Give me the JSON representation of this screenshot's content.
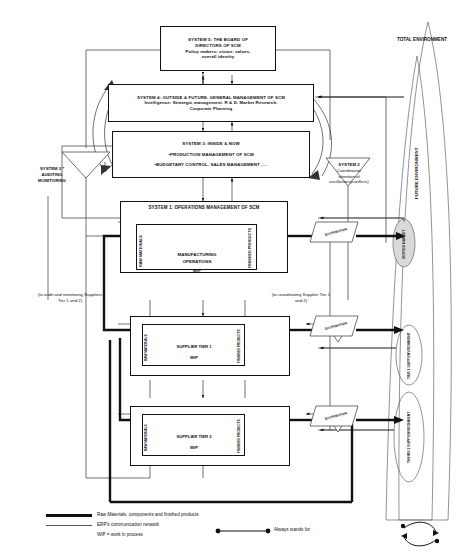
{
  "diagram": {
    "systems": {
      "system5": {
        "lines": [
          "SYSTEM 5: THE BOARD OF",
          "DIRECTORS OF SCM",
          "Policy makers: vision. values.",
          "overall identity"
        ]
      },
      "system4": {
        "lines": [
          "SYSTEM 4: OUTSIDE & FUTURE. GENERAL MANAGEMENT OF SCM",
          "Intelligence: Strategic management. R & D. Market Research.",
          "Corporate Planning"
        ]
      },
      "system3": {
        "lines": [
          "SYSTEM 3: INSIDE & NOW",
          "•PRODUCTION MANAGEMENT OF SCM",
          "•BUDGETARY CONTROL. SALES MANAGEMENT ....."
        ]
      },
      "system3star": {
        "lines": [
          "SYSTEM 3 *",
          "AUDITING",
          "MONITORING"
        ]
      },
      "system2": {
        "lines": [
          "SYSTEM 2",
          "Coordination",
          "attention of",
          "oscillations(conflicts)"
        ]
      },
      "system1": {
        "title": "SYSTEM 1: OPERATIONS MANAGEMENT OF SCM",
        "raw": "RAW MATERIALS",
        "center_1": "MANUFACTURING",
        "center_2": "OPERATIONS",
        "wip": "WIP",
        "finished": "FINISHED  PRODUCTS"
      }
    },
    "suppliers": [
      {
        "title": "SUPPLIER TIER 1",
        "raw": "RAW MATERIALS",
        "wip": "WIP",
        "finished": "FINISHED PRODUCTS",
        "distribution": "DISTRIBUTION"
      },
      {
        "title": "SUPPLIER TIER 2",
        "raw": "RAW MATERIALS",
        "wip": "WIP",
        "finished": "FINISHED PRODUCTS",
        "distribution": "DISTRIBUTION"
      }
    ],
    "distribution_main": "DISTRIBUTION",
    "annotations": {
      "audit_note": "(to audit and monitoring Suppliers Tier 1 and 2)",
      "coordinate_note": "(to coordinating Supplier Tier 1 and 2)"
    },
    "environments": {
      "total": "TOTAL ENVIRONMENT",
      "future": "FUTURE ENVIRONMENT",
      "served_market": "SERVED MARKET",
      "tier1": "TIER 1 SUPP ENVIRONMENT",
      "tier2": "THEIRS 2 SUPP ENVIRONMENT"
    },
    "legend": {
      "thick_label": "Raw Materials, components and finished products",
      "thin_label": "ERP's communication network",
      "wip_label": "WIP = work in process",
      "always_label": "Always stands for"
    },
    "colors": {
      "line": "#111111",
      "thin_line": "#555555",
      "shaded_fill": "#d9d9d9",
      "background": "#ffffff"
    }
  }
}
